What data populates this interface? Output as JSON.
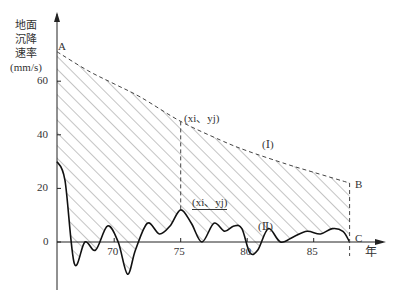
{
  "chart_data": {
    "type": "line",
    "title": "",
    "xlabel": "年",
    "ylabel": "地面沉降速率 (mm/s)",
    "ylabel_lines": [
      "地面",
      "沉降",
      "速率",
      "(mm/s)"
    ],
    "x_ticks": [
      "70",
      "75",
      "80",
      "85"
    ],
    "y_ticks": [
      "0",
      "20",
      "40",
      "60"
    ],
    "xlim": [
      65.7,
      88
    ],
    "ylim": [
      -15,
      80
    ],
    "points": {
      "A": "A",
      "B": "B",
      "C": "C"
    },
    "annotations": {
      "upper_point": "(xi、yj)",
      "lower_point": "(xi、yj)",
      "curve_I": "(Ⅰ)",
      "curve_II": "(Ⅱ)"
    },
    "series": [
      {
        "name": "(Ⅰ) envelope (dashed)",
        "style": "dashed",
        "x": [
          65.7,
          68,
          70,
          72,
          75,
          78,
          80,
          83,
          85,
          87.7
        ],
        "y": [
          71,
          64,
          59,
          54,
          45,
          38,
          34,
          29,
          26,
          22
        ]
      },
      {
        "name": "(Ⅱ) actual rate (solid)",
        "style": "solid",
        "x": [
          65.7,
          66.3,
          67,
          67.8,
          68.6,
          69.5,
          70.3,
          71,
          71.6,
          72.5,
          73.4,
          74.2,
          75,
          75.8,
          76.6,
          77.5,
          78.3,
          79,
          79.6,
          80.2,
          80.8,
          81.6,
          82.5,
          83.5,
          84.5,
          85.5,
          86.4,
          87.2,
          87.7
        ],
        "y": [
          30,
          23,
          -8,
          0,
          -3,
          6,
          0,
          -12,
          -3,
          7,
          3,
          6,
          12,
          7,
          0,
          7,
          4,
          6,
          5,
          -4,
          -3,
          5,
          0,
          2,
          4,
          3,
          5,
          4,
          0
        ]
      }
    ],
    "marked_x": 75,
    "grid": false,
    "legend": "none"
  }
}
